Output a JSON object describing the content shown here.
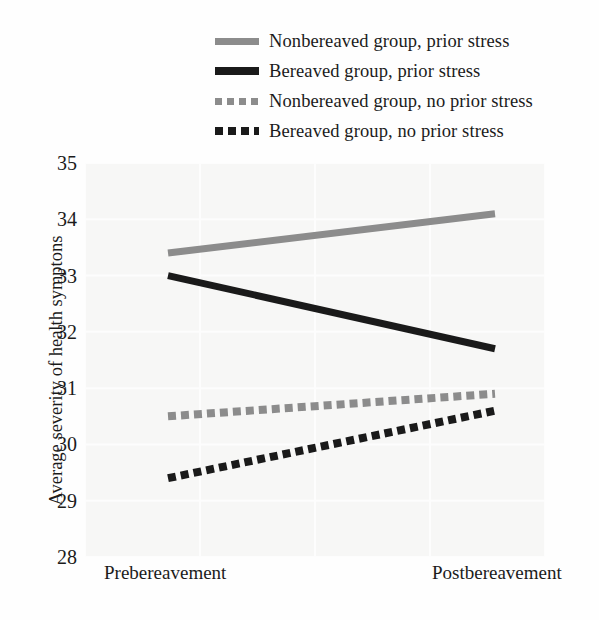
{
  "chart_data": {
    "type": "line",
    "title": "",
    "xlabel": "",
    "ylabel": "Average severity of health symptons",
    "categories": [
      "Prebereavement",
      "Postbereavement"
    ],
    "x": [
      0,
      1
    ],
    "ylim": [
      28,
      35
    ],
    "yticks": [
      35,
      34,
      33,
      32,
      31,
      30,
      29,
      28
    ],
    "ytick_labels": [
      "35",
      "34",
      "33",
      "32",
      "31",
      "30",
      "29",
      "28"
    ],
    "grid": true,
    "legend_position": "top",
    "series": [
      {
        "name": "Nonbereaved group, prior stress",
        "values": [
          33.4,
          34.1
        ],
        "color": "#8c8c8c",
        "style": "solid",
        "swatch": "sw-solid-gray"
      },
      {
        "name": "Bereaved group, prior stress",
        "values": [
          33.0,
          31.7
        ],
        "color": "#1a1a1a",
        "style": "solid",
        "swatch": "sw-solid-black"
      },
      {
        "name": "Nonbereaved group, no prior stress",
        "values": [
          30.5,
          30.9
        ],
        "color": "#8c8c8c",
        "style": "dotted",
        "swatch": "sw-dot-gray"
      },
      {
        "name": "Bereaved group, no prior stress",
        "values": [
          29.4,
          30.6
        ],
        "color": "#1a1a1a",
        "style": "dotted",
        "swatch": "sw-dot-black"
      }
    ]
  },
  "legend": {
    "items": [
      {
        "label": "Nonbereaved group, prior stress"
      },
      {
        "label": "Bereaved group, prior stress"
      },
      {
        "label": "Nonbereaved group, no prior stress"
      },
      {
        "label": "Bereaved group, no prior stress"
      }
    ]
  },
  "axes": {
    "y_title": "Average severity of health symptons",
    "y_tick_labels": [
      "35",
      "34",
      "33",
      "32",
      "31",
      "30",
      "29",
      "28"
    ],
    "x_tick_labels": [
      "Prebereavement",
      "Postbereavement"
    ]
  },
  "colors": {
    "gray_series": "#8c8c8c",
    "black_series": "#1a1a1a",
    "plot_background": "#f7f7f6",
    "gridline": "#fdfdfd",
    "text": "#1b1b1b"
  }
}
